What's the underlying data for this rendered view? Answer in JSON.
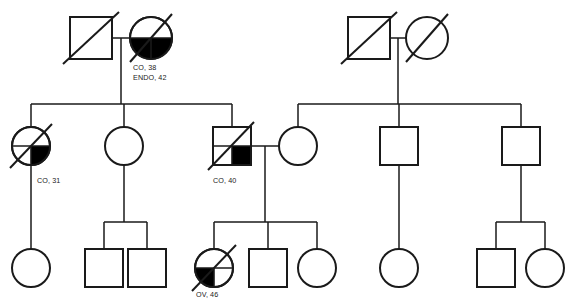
{
  "chart_title": "Family Pedigree Chart",
  "canvas": {
    "width": 574,
    "height": 299,
    "background": "#ffffff"
  },
  "style": {
    "line_color": "#1a1a1a",
    "fill_color": "#000000",
    "unaffected_fill": "#ffffff"
  },
  "legend_terms": {
    "CO": "CO",
    "ENDO": "ENDO",
    "OV": "OV"
  },
  "labels": {
    "gen1_mother": {
      "line1": "CO, 38",
      "line2": "ENDO, 42"
    },
    "gen2_daughter_left": {
      "line1": "CO, 31"
    },
    "gen2_son_right": {
      "line1": "CO, 40"
    },
    "gen3_daughter_affected": {
      "line1": "OV, 46"
    }
  },
  "individuals": [
    {
      "id": "I-1",
      "name": "gen1-father-left",
      "sex": "male",
      "shape": "square",
      "generation": 1,
      "deceased": true,
      "affected": false,
      "affected_quadrants": [],
      "x": 91,
      "y": 38,
      "label": ""
    },
    {
      "id": "I-2",
      "name": "gen1-mother-left",
      "sex": "female",
      "shape": "circle",
      "generation": 1,
      "deceased": true,
      "affected": true,
      "affected_quadrants": [
        "lower-left",
        "lower-right"
      ],
      "x": 151,
      "y": 38,
      "label": "CO, 38 / ENDO, 42"
    },
    {
      "id": "I-3",
      "name": "gen1-father-right",
      "sex": "male",
      "shape": "square",
      "generation": 1,
      "deceased": true,
      "affected": false,
      "affected_quadrants": [],
      "x": 369,
      "y": 38,
      "label": ""
    },
    {
      "id": "I-4",
      "name": "gen1-mother-right",
      "sex": "female",
      "shape": "circle",
      "generation": 1,
      "deceased": true,
      "affected": false,
      "affected_quadrants": [],
      "x": 427,
      "y": 38,
      "label": ""
    },
    {
      "id": "II-1",
      "name": "gen2-daughter-affected-left",
      "sex": "female",
      "shape": "circle",
      "generation": 2,
      "deceased": true,
      "affected": true,
      "affected_quadrants": [
        "lower-right"
      ],
      "x": 31,
      "y": 146,
      "label": "CO, 31"
    },
    {
      "id": "II-2",
      "name": "gen2-daughter-middle",
      "sex": "female",
      "shape": "circle",
      "generation": 2,
      "deceased": false,
      "affected": false,
      "affected_quadrants": [],
      "x": 124,
      "y": 146,
      "label": ""
    },
    {
      "id": "II-3",
      "name": "gen2-son-affected",
      "sex": "male",
      "shape": "square",
      "generation": 2,
      "deceased": true,
      "affected": true,
      "affected_quadrants": [
        "lower-right"
      ],
      "x": 232,
      "y": 146,
      "label": "CO, 40"
    },
    {
      "id": "II-4",
      "name": "gen2-daughter-right-spouse",
      "sex": "female",
      "shape": "circle",
      "generation": 2,
      "deceased": false,
      "affected": false,
      "affected_quadrants": [],
      "x": 298,
      "y": 146,
      "label": ""
    },
    {
      "id": "II-5",
      "name": "gen2-son-middle-right",
      "sex": "male",
      "shape": "square",
      "generation": 2,
      "deceased": false,
      "affected": false,
      "affected_quadrants": [],
      "x": 399,
      "y": 146,
      "label": ""
    },
    {
      "id": "II-6",
      "name": "gen2-son-far-right",
      "sex": "male",
      "shape": "square",
      "generation": 2,
      "deceased": false,
      "affected": false,
      "affected_quadrants": [],
      "x": 521,
      "y": 146,
      "label": ""
    },
    {
      "id": "III-1",
      "name": "gen3-daughter-far-left",
      "sex": "female",
      "shape": "circle",
      "generation": 3,
      "deceased": false,
      "affected": false,
      "affected_quadrants": [],
      "x": 31,
      "y": 268,
      "label": ""
    },
    {
      "id": "III-2",
      "name": "gen3-son-left",
      "sex": "male",
      "shape": "square",
      "generation": 3,
      "deceased": false,
      "affected": false,
      "affected_quadrants": [],
      "x": 104,
      "y": 268,
      "label": ""
    },
    {
      "id": "III-3",
      "name": "gen3-son-left-2",
      "sex": "male",
      "shape": "square",
      "generation": 3,
      "deceased": false,
      "affected": false,
      "affected_quadrants": [],
      "x": 147,
      "y": 268,
      "label": ""
    },
    {
      "id": "III-4",
      "name": "gen3-daughter-affected",
      "sex": "female",
      "shape": "circle",
      "generation": 3,
      "deceased": true,
      "affected": true,
      "affected_quadrants": [
        "lower-left"
      ],
      "x": 214,
      "y": 268,
      "label": "OV, 46"
    },
    {
      "id": "III-5",
      "name": "gen3-son-middle",
      "sex": "male",
      "shape": "square",
      "generation": 3,
      "deceased": false,
      "affected": false,
      "affected_quadrants": [],
      "x": 268,
      "y": 268,
      "label": ""
    },
    {
      "id": "III-6",
      "name": "gen3-daughter-middle",
      "sex": "female",
      "shape": "circle",
      "generation": 3,
      "deceased": false,
      "affected": false,
      "affected_quadrants": [],
      "x": 317,
      "y": 268,
      "label": ""
    },
    {
      "id": "III-7",
      "name": "gen3-daughter-right",
      "sex": "female",
      "shape": "circle",
      "generation": 3,
      "deceased": false,
      "affected": false,
      "affected_quadrants": [],
      "x": 399,
      "y": 268,
      "label": ""
    },
    {
      "id": "III-8",
      "name": "gen3-son-far-right",
      "sex": "male",
      "shape": "square",
      "generation": 3,
      "deceased": false,
      "affected": false,
      "affected_quadrants": [],
      "x": 496,
      "y": 268,
      "label": ""
    },
    {
      "id": "III-9",
      "name": "gen3-daughter-far-right",
      "sex": "female",
      "shape": "circle",
      "generation": 3,
      "deceased": false,
      "affected": false,
      "affected_quadrants": [],
      "x": 545,
      "y": 268,
      "label": ""
    }
  ],
  "unions": [
    {
      "name": "union-gen1-left",
      "partners": [
        "I-1",
        "I-2"
      ],
      "children": [
        "II-1",
        "II-2",
        "II-3"
      ]
    },
    {
      "name": "union-gen1-right",
      "partners": [
        "I-3",
        "I-4"
      ],
      "children": [
        "II-4",
        "II-5",
        "II-6"
      ]
    },
    {
      "name": "union-gen2-affected",
      "partners": [
        "II-3",
        "II-4"
      ],
      "children": [
        "III-4",
        "III-5",
        "III-6"
      ]
    },
    {
      "name": "union-gen2-left-daughter",
      "partners": [
        "II-1"
      ],
      "children": [
        "III-1"
      ]
    },
    {
      "name": "union-gen2-middle-daughter",
      "partners": [
        "II-2"
      ],
      "children": [
        "III-2",
        "III-3"
      ]
    },
    {
      "name": "union-gen2-middle-right-son",
      "partners": [
        "II-5"
      ],
      "children": [
        "III-7"
      ]
    },
    {
      "name": "union-gen2-far-right-son",
      "partners": [
        "II-6"
      ],
      "children": [
        "III-8",
        "III-9"
      ]
    }
  ]
}
